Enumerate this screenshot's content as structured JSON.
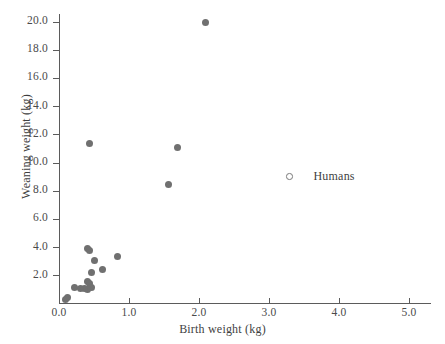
{
  "chart_data": {
    "type": "scatter",
    "title": "",
    "xlabel": "Birth weight (kg)",
    "ylabel": "Weaning weight (kg)",
    "xlim": [
      0.0,
      5.3
    ],
    "ylim": [
      0.0,
      20.8
    ],
    "xticks": [
      "0.0",
      "1.0",
      "2.0",
      "3.0",
      "4.0",
      "5.0"
    ],
    "xtick_values": [
      0.0,
      1.0,
      2.0,
      3.0,
      4.0,
      5.0
    ],
    "yticks": [
      "2.0",
      "4.0",
      "6.0",
      "8.0",
      "10.0",
      "12.0",
      "14.0",
      "16.0",
      "18.0",
      "20.0"
    ],
    "ytick_values": [
      2.0,
      4.0,
      6.0,
      8.0,
      10.0,
      12.0,
      14.0,
      16.0,
      18.0,
      20.0
    ],
    "grid": false,
    "legend_position": "center-right",
    "marker_color": "#707070",
    "axis_color": "#5b5b5b",
    "text_color": "#3f3f3f",
    "background": "#ffffff",
    "legend": [
      {
        "name": "Humans",
        "marker": "open-circle"
      }
    ],
    "series": [
      {
        "name": "Primates",
        "marker": "filled-circle",
        "points": [
          {
            "x": 2.09,
            "y": 20.0
          },
          {
            "x": 0.43,
            "y": 11.4
          },
          {
            "x": 1.69,
            "y": 11.1
          },
          {
            "x": 1.56,
            "y": 8.5
          },
          {
            "x": 0.4,
            "y": 3.95
          },
          {
            "x": 0.44,
            "y": 3.8
          },
          {
            "x": 0.5,
            "y": 3.1
          },
          {
            "x": 0.84,
            "y": 3.35
          },
          {
            "x": 0.62,
            "y": 2.45
          },
          {
            "x": 0.47,
            "y": 2.25
          },
          {
            "x": 0.41,
            "y": 1.6
          },
          {
            "x": 0.44,
            "y": 1.45
          },
          {
            "x": 0.46,
            "y": 1.2
          },
          {
            "x": 0.4,
            "y": 1.05
          },
          {
            "x": 0.36,
            "y": 1.1
          },
          {
            "x": 0.3,
            "y": 1.1
          },
          {
            "x": 0.22,
            "y": 1.2
          },
          {
            "x": 0.12,
            "y": 0.45
          },
          {
            "x": 0.09,
            "y": 0.3
          }
        ]
      }
    ],
    "axis_pixel_mapping": {
      "x_origin_px": 59,
      "x_px_per_unit": 70,
      "y_origin_px": 304,
      "y_px_per_unit": 14.1
    }
  }
}
